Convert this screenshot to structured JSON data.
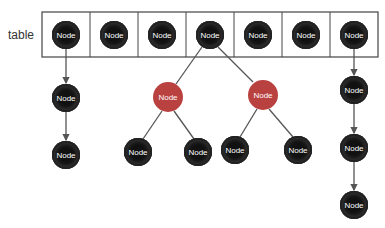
{
  "diagram": {
    "table_label": "table",
    "colors": {
      "black_node": "#111111",
      "red_node": "#b9413f",
      "edge": "#555555",
      "table_border": "#444444"
    },
    "table": {
      "x": 42,
      "y": 12,
      "width": 336,
      "height": 45,
      "cells": 7,
      "nodes": [
        {
          "label": "Node",
          "x": 66,
          "y": 35
        },
        {
          "label": "Node",
          "x": 114,
          "y": 35
        },
        {
          "label": "Node",
          "x": 162,
          "y": 35
        },
        {
          "label": "Node",
          "x": 210,
          "y": 35
        },
        {
          "label": "Node",
          "x": 258,
          "y": 35
        },
        {
          "label": "Node",
          "x": 306,
          "y": 35
        },
        {
          "label": "Node",
          "x": 354,
          "y": 35
        }
      ]
    },
    "nodes": [
      {
        "id": "c1a",
        "label": "Node",
        "x": 66,
        "y": 98,
        "type": "black"
      },
      {
        "id": "c1b",
        "label": "Node",
        "x": 66,
        "y": 155,
        "type": "black"
      },
      {
        "id": "r1",
        "label": "Node",
        "x": 168,
        "y": 97,
        "type": "red"
      },
      {
        "id": "r1l",
        "label": "Node",
        "x": 138,
        "y": 152,
        "type": "black"
      },
      {
        "id": "r1r",
        "label": "Node",
        "x": 198,
        "y": 152,
        "type": "black"
      },
      {
        "id": "r2",
        "label": "Node",
        "x": 263,
        "y": 95,
        "type": "red"
      },
      {
        "id": "r2l",
        "label": "Node",
        "x": 235,
        "y": 150,
        "type": "black"
      },
      {
        "id": "r2r",
        "label": "Node",
        "x": 298,
        "y": 150,
        "type": "black"
      },
      {
        "id": "c7a",
        "label": "Node",
        "x": 354,
        "y": 90,
        "type": "black"
      },
      {
        "id": "c7b",
        "label": "Node",
        "x": 354,
        "y": 148,
        "type": "black"
      },
      {
        "id": "c7c",
        "label": "Node",
        "x": 354,
        "y": 205,
        "type": "black"
      }
    ],
    "edges": [
      {
        "x1": 66,
        "y1": 49,
        "x2": 66,
        "y2": 83,
        "arrow": true
      },
      {
        "x1": 66,
        "y1": 112,
        "x2": 66,
        "y2": 140,
        "arrow": true
      },
      {
        "x1": 202,
        "y1": 47,
        "x2": 176,
        "y2": 84,
        "arrow": false
      },
      {
        "x1": 218,
        "y1": 47,
        "x2": 253,
        "y2": 82,
        "arrow": false
      },
      {
        "x1": 162,
        "y1": 111,
        "x2": 143,
        "y2": 139,
        "arrow": false
      },
      {
        "x1": 174,
        "y1": 111,
        "x2": 194,
        "y2": 139,
        "arrow": false
      },
      {
        "x1": 257,
        "y1": 109,
        "x2": 240,
        "y2": 137,
        "arrow": false
      },
      {
        "x1": 269,
        "y1": 109,
        "x2": 293,
        "y2": 137,
        "arrow": false
      },
      {
        "x1": 354,
        "y1": 49,
        "x2": 354,
        "y2": 75,
        "arrow": true
      },
      {
        "x1": 354,
        "y1": 104,
        "x2": 354,
        "y2": 133,
        "arrow": true
      },
      {
        "x1": 354,
        "y1": 162,
        "x2": 354,
        "y2": 190,
        "arrow": true
      }
    ]
  }
}
